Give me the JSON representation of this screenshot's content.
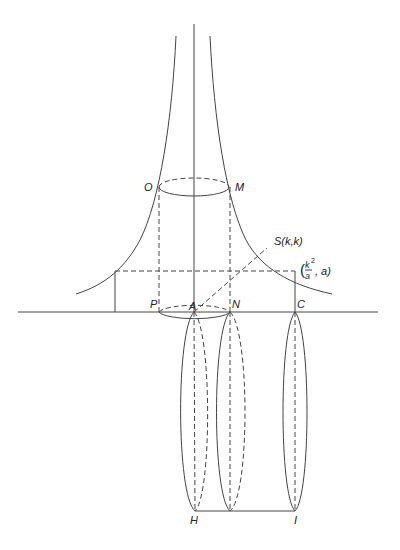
{
  "diagram": {
    "title": "",
    "labels": {
      "O": "O",
      "M": "M",
      "S": "S(k,k)",
      "point_paren_open": "(",
      "point_k2": "k",
      "point_sup": "2",
      "point_a_den": "a",
      "point_rest": ", a)",
      "P": "P",
      "A": "A",
      "N": "N",
      "C": "C",
      "H": "H",
      "I": "I"
    },
    "colors": {
      "stroke": "#444444",
      "text": "#222222",
      "background": "#ffffff"
    }
  }
}
